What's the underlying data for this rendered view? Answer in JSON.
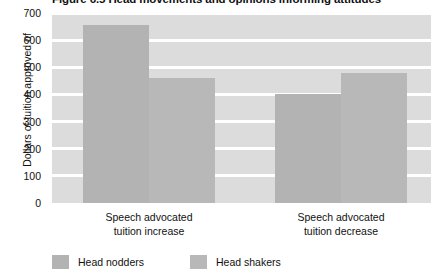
{
  "figure": {
    "title": "Figure 6.5  Head movements and opinions informing attitudes"
  },
  "colors": {
    "plot_background": "#dcdcdc",
    "gridline": "#ffffff",
    "head_nodders": "#b3b3b3",
    "head_shakers": "#b8b8b8",
    "text": "#111111"
  },
  "chart_data": {
    "type": "bar",
    "title": "Figure 6.5  Head movements and opinions informing attitudes",
    "xlabel": "",
    "ylabel": "Dollars of tuition approved of",
    "ylim": [
      0,
      700
    ],
    "yticks": [
      0,
      100,
      200,
      300,
      400,
      500,
      600,
      700
    ],
    "ytick_labels": [
      "0",
      "100",
      "200",
      "300",
      "400",
      "500",
      "600",
      "700"
    ],
    "grid": true,
    "grid_orientation": "horizontal",
    "legend_position": "below-left",
    "categories": [
      "Speech advocated tuition increase",
      "Speech advocated tuition decrease"
    ],
    "category_lines": [
      [
        "Speech advocated",
        "tuition increase"
      ],
      [
        "Speech advocated",
        "tuition decrease"
      ]
    ],
    "series": [
      {
        "name": "Head nodders",
        "color": "#b3b3b3",
        "values": [
          655,
          400
        ]
      },
      {
        "name": "Head shakers",
        "color": "#b8b8b8",
        "values": [
          460,
          480
        ]
      }
    ]
  }
}
